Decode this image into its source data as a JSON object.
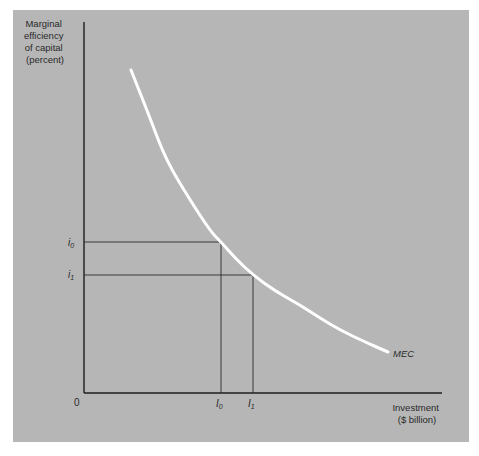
{
  "chart_data": {
    "type": "line",
    "title": "",
    "ylabel": "Marginal efficiency of capital (percent)",
    "ylabel_lines": [
      "Marginal",
      "efficiency",
      "of capital",
      "(percent)"
    ],
    "xlabel": "Investment ($ billion)",
    "xlabel_lines": [
      "Investment",
      "($ billion)"
    ],
    "origin_label": "0",
    "series": [
      {
        "name": "MEC",
        "label": "MEC",
        "color": "#ffffff",
        "points_px": [
          [
            131,
            70
          ],
          [
            150,
            118
          ],
          [
            166,
            160
          ],
          [
            190,
            200
          ],
          [
            211,
            232
          ],
          [
            221,
            242
          ],
          [
            236,
            259
          ],
          [
            253,
            275
          ],
          [
            275,
            291
          ],
          [
            300,
            305
          ],
          [
            320,
            318
          ],
          [
            340,
            330
          ],
          [
            365,
            342
          ],
          [
            388,
            352
          ]
        ]
      }
    ],
    "reference_levels": [
      {
        "y_label": "i0",
        "y_sub": "0",
        "x_label": "I0",
        "x_sub": "0",
        "px": {
          "x": 221,
          "y": 242
        }
      },
      {
        "y_label": "i1",
        "y_sub": "1",
        "x_label": "I1",
        "x_sub": "1",
        "px": {
          "x": 253,
          "y": 275
        }
      }
    ],
    "axes_px": {
      "origin_x": 84,
      "origin_y": 393,
      "y_top": 22,
      "x_right": 442
    },
    "grid": false,
    "legend": "none (curve labeled inline)"
  },
  "colors": {
    "panel": "#b6b6b6",
    "axis": "#1e1e1e",
    "curve": "#ffffff",
    "text": "#2a2a2a"
  }
}
